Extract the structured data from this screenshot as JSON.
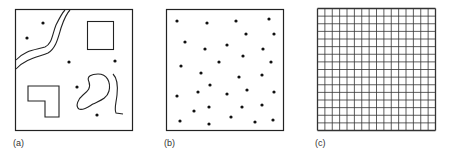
{
  "panels": [
    {
      "id": "a",
      "label": "(a)",
      "description": "Map with features: river, buildings, lake, road, and point objects"
    },
    {
      "id": "b",
      "label": "(b)",
      "description": "Point pattern (random distribution of points)"
    },
    {
      "id": "c",
      "label": "(c)",
      "description": "Regular grid",
      "grid_rows": 16,
      "grid_cols": 16
    }
  ],
  "colors": {
    "ink": "#222222",
    "background": "#ffffff"
  }
}
